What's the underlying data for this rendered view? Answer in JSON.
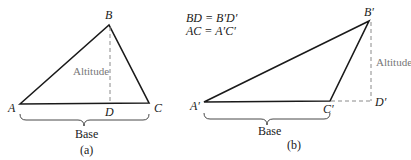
{
  "figure_a": {
    "vertices": {
      "A": "A",
      "B": "B",
      "C": "C",
      "D": "D"
    },
    "altitude_label": "Altitude",
    "base_label": "Base",
    "caption": "(a)"
  },
  "figure_b": {
    "vertices": {
      "A": "A′",
      "B": "B′",
      "C": "C′",
      "D": "D′"
    },
    "altitude_label": "Altitude",
    "base_label": "Base",
    "caption": "(b)",
    "equations": [
      "BD = B′D′",
      "AC = A′C′"
    ]
  },
  "colors": {
    "line": "#1a1a1a",
    "altitude": "#8a8a8a",
    "text": "#1a1a1a",
    "muted_text": "#777777"
  }
}
